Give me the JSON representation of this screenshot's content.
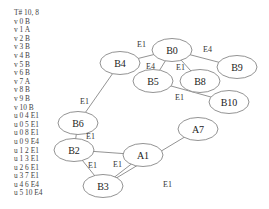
{
  "graph_text": {
    "header": "T# 10, 8",
    "lines": [
      "v 0 B",
      "v 1 A",
      "v 2 B",
      "v 3 B",
      "v 4 B",
      "v 5 B",
      "v 6 B",
      "v 7 A",
      "v 8 B",
      "v 9 B",
      "v 10 B",
      "u 0 4 E1",
      "u 0 5 E1",
      "u 0 8 E1",
      "u 0 9 E4",
      "u 1 2 E1",
      "u 1 3 E1",
      "u 2 6 E1",
      "u 3 7 E1",
      "u 4 6 E4",
      "u 5 10 E4"
    ]
  },
  "nodes": [
    {
      "id": "B0",
      "label": "B0",
      "cx": 172,
      "cy": 50
    },
    {
      "id": "B9",
      "label": "B9",
      "cx": 237,
      "cy": 67
    },
    {
      "id": "B4",
      "label": "B4",
      "cx": 120,
      "cy": 63
    },
    {
      "id": "B5",
      "label": "B5",
      "cx": 153,
      "cy": 81
    },
    {
      "id": "B8",
      "label": "B8",
      "cx": 200,
      "cy": 81
    },
    {
      "id": "B10",
      "label": "B10",
      "cx": 229,
      "cy": 102
    },
    {
      "id": "B6",
      "label": "B6",
      "cx": 78,
      "cy": 123
    },
    {
      "id": "B2",
      "label": "B2",
      "cx": 74,
      "cy": 150
    },
    {
      "id": "A1",
      "label": "A1",
      "cx": 143,
      "cy": 155
    },
    {
      "id": "A7",
      "label": "A7",
      "cx": 198,
      "cy": 129
    },
    {
      "id": "B3",
      "label": "B3",
      "cx": 103,
      "cy": 186
    }
  ],
  "edges": [
    {
      "from": "B0",
      "to": "B4",
      "label": "E1",
      "lx": 137,
      "ly": 47
    },
    {
      "from": "B0",
      "to": "B9",
      "label": "E4",
      "lx": 203,
      "ly": 52
    },
    {
      "from": "B0",
      "to": "B5",
      "label": "E4",
      "lx": 146,
      "ly": 69
    },
    {
      "from": "B0",
      "to": "B8",
      "label": "E1",
      "lx": 176,
      "ly": 70
    },
    {
      "from": "B5",
      "to": "B10",
      "label": "E1",
      "lx": 175,
      "ly": 100
    },
    {
      "from": "B4",
      "to": "B6",
      "label": "E1",
      "lx": 80,
      "ly": 104
    },
    {
      "from": "B6",
      "to": "B2",
      "label": "E1",
      "lx": 86,
      "ly": 139
    },
    {
      "from": "B2",
      "to": "A1",
      "label": "",
      "lx": 0,
      "ly": 0
    },
    {
      "from": "A1",
      "to": "B3",
      "label": "E1",
      "lx": 113,
      "ly": 167
    },
    {
      "from": "B2",
      "to": "B3",
      "label": "E1",
      "lx": 88,
      "ly": 168
    },
    {
      "from": "B3",
      "to": "A7",
      "label": "E1",
      "lx": 163,
      "ly": 187
    }
  ]
}
